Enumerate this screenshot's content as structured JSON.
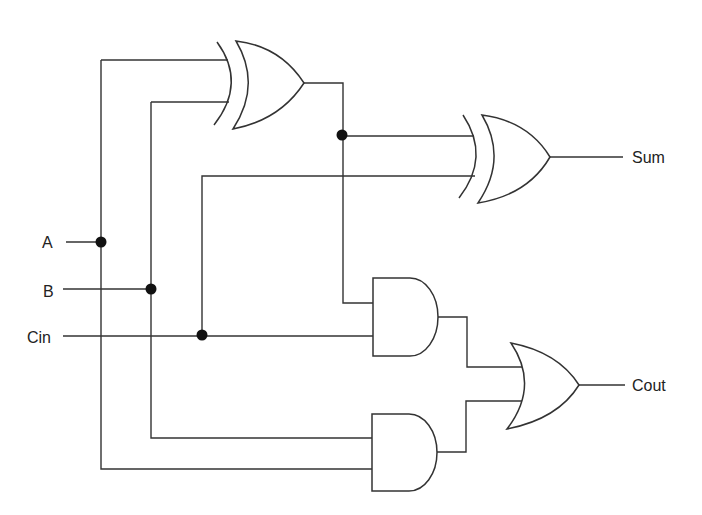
{
  "diagram": {
    "type": "logic-circuit",
    "colors": {
      "line": "#333333",
      "background": "#ffffff",
      "junction": "#111111"
    },
    "inputs": [
      {
        "id": "A",
        "label": "A"
      },
      {
        "id": "B",
        "label": "B"
      },
      {
        "id": "Cin",
        "label": "Cin"
      }
    ],
    "outputs": [
      {
        "id": "Sum",
        "label": "Sum"
      },
      {
        "id": "Cout",
        "label": "Cout"
      }
    ],
    "gates": [
      {
        "id": "xor1",
        "type": "XOR",
        "inputs": [
          "A",
          "B"
        ]
      },
      {
        "id": "xor2",
        "type": "XOR",
        "inputs": [
          "xor1",
          "Cin"
        ],
        "output": "Sum"
      },
      {
        "id": "and1",
        "type": "AND",
        "inputs": [
          "xor1",
          "Cin"
        ]
      },
      {
        "id": "and2",
        "type": "AND",
        "inputs": [
          "B",
          "A"
        ]
      },
      {
        "id": "or1",
        "type": "OR",
        "inputs": [
          "and1",
          "and2"
        ],
        "output": "Cout"
      }
    ],
    "junctions": 4
  }
}
